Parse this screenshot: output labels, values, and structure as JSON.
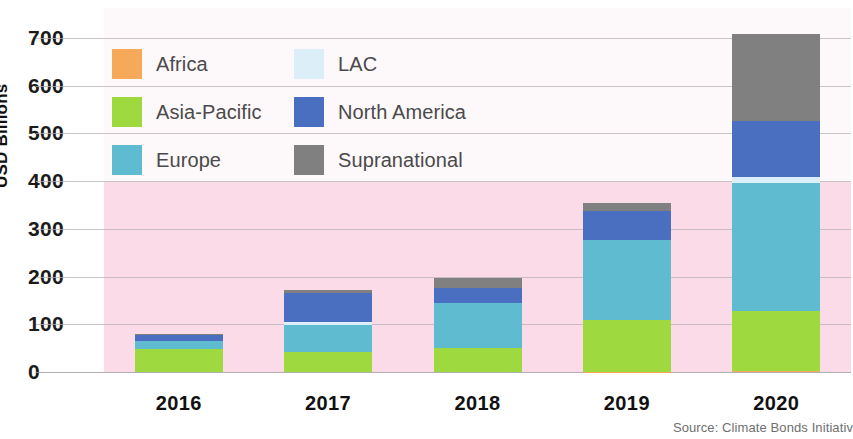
{
  "chart_data": {
    "type": "bar",
    "stacked": true,
    "title": "",
    "xlabel": "",
    "ylabel": "USD Billions",
    "categories": [
      "2016",
      "2017",
      "2018",
      "2019",
      "2020"
    ],
    "ylim": [
      0,
      700
    ],
    "yticks": [
      0,
      100,
      200,
      300,
      400,
      500,
      600,
      700
    ],
    "ytick_labels": [
      "0",
      "100",
      "200",
      "300",
      "400",
      "500",
      "600",
      "700"
    ],
    "grid": true,
    "legend_position": "upper-left-inside",
    "series": [
      {
        "name": "Africa",
        "color": "#f5a959",
        "values": [
          0,
          0,
          0,
          1,
          2
        ]
      },
      {
        "name": "Asia-Pacific",
        "color": "#9ed93f",
        "values": [
          48,
          42,
          50,
          108,
          125
        ]
      },
      {
        "name": "Europe",
        "color": "#5ebbd0",
        "values": [
          18,
          56,
          94,
          167,
          269
        ]
      },
      {
        "name": "LAC",
        "color": "#dceef8",
        "values": [
          0,
          6,
          0,
          0,
          12
        ]
      },
      {
        "name": "North America",
        "color": "#4a6fc0",
        "values": [
          12,
          62,
          33,
          62,
          119
        ]
      },
      {
        "name": "Supranational",
        "color": "#808080",
        "values": [
          2,
          5,
          21,
          17,
          181
        ]
      }
    ],
    "totals": [
      80,
      171,
      198,
      355,
      708
    ],
    "source": "Source: Climate Bonds Initiativ"
  },
  "legend": {
    "items": [
      {
        "label": "Africa",
        "color": "#f5a959"
      },
      {
        "label": "LAC",
        "color": "#dceef8"
      },
      {
        "label": "Asia-Pacific",
        "color": "#9ed93f"
      },
      {
        "label": "North America",
        "color": "#4a6fc0"
      },
      {
        "label": "Europe",
        "color": "#5ebbd0"
      },
      {
        "label": "Supranational",
        "color": "#808080"
      }
    ]
  },
  "axis": {
    "y_title": "USD Billions"
  },
  "footer": {
    "source": "Source: Climate Bonds Initiativ"
  },
  "colors": {
    "plot_background_pink": "#fadbe7",
    "plot_background_white": "#fdf8fa",
    "gridline": "#b9b0b4",
    "text": "#1b1b1b",
    "legend_text": "#4a4a4a",
    "source_text": "#6f6f6f"
  }
}
